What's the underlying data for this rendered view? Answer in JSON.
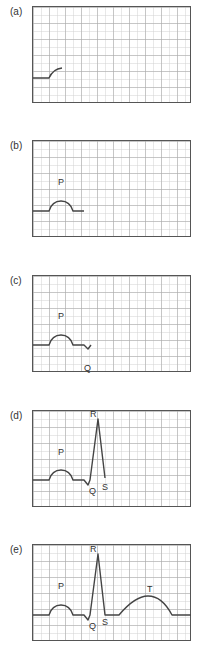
{
  "panels": [
    {
      "label": "(a)",
      "wave_labels": {}
    },
    {
      "label": "(b)",
      "wave_labels": {
        "P": "P"
      }
    },
    {
      "label": "(c)",
      "wave_labels": {
        "P": "P",
        "Q": "Q"
      }
    },
    {
      "label": "(d)",
      "wave_labels": {
        "P": "P",
        "Q": "Q",
        "R": "R",
        "S": "S"
      }
    },
    {
      "label": "(e)",
      "wave_labels": {
        "P": "P",
        "Q": "Q",
        "R": "R",
        "S": "S",
        "T": "T"
      }
    }
  ],
  "colors": {
    "trace": "#444444",
    "frame": "#555555",
    "grid": "#cccccc"
  }
}
